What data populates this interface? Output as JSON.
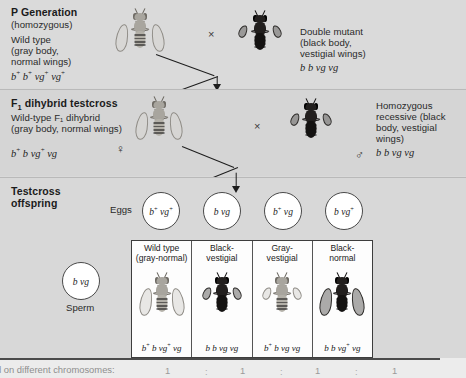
{
  "figure": {
    "background": "#d9d9d9"
  },
  "sections": {
    "p_generation": {
      "title": "P Generation",
      "subtitle": "(homozygous)",
      "cross_symbol": "×",
      "parents": [
        {
          "name": "Wild type",
          "description": "(gray body,\nnormal wings)",
          "desc_line1": "Wild type",
          "desc_line2": "(gray body,",
          "desc_line3": "normal wings)",
          "genotype_html": "b<sup>+</sup> b<sup>+</sup> vg<sup>+</sup> vg<sup>+</sup>",
          "body_color": "gray",
          "wing_type": "normal"
        },
        {
          "desc_line1": "Double mutant",
          "desc_line2": "(black body,",
          "desc_line3": "vestigial wings)",
          "genotype_html": "b b vg vg",
          "body_color": "black",
          "wing_type": "vestigial"
        }
      ]
    },
    "f1_testcross": {
      "title_main": "F",
      "title_sub": "1",
      "title_rest": " dihybrid testcross",
      "cross_symbol": "×",
      "female": {
        "desc_line1": "Wild-type F₁ dihybrid",
        "desc_line2": "(gray body, normal wings)",
        "genotype_html": "b<sup>+</sup> b vg<sup>+</sup> vg",
        "sex_symbol": "♀",
        "body_color": "gray",
        "wing_type": "normal"
      },
      "male": {
        "desc_line1": "Homozygous",
        "desc_line2": "recessive (black",
        "desc_line3": "body, vestigial",
        "desc_line4": "wings)",
        "genotype_html": "b b vg vg",
        "sex_symbol": "♂",
        "body_color": "black",
        "wing_type": "vestigial"
      }
    },
    "testcross_offspring": {
      "title_line1": "Testcross",
      "title_line2": "offspring",
      "eggs_label": "Eggs",
      "sperm_label": "Sperm",
      "eggs": [
        {
          "genotype_html": "b<sup>+</sup> vg<sup>+</sup>"
        },
        {
          "genotype_html": "b vg"
        },
        {
          "genotype_html": "b<sup>+</sup> vg"
        },
        {
          "genotype_html": "b vg<sup>+</sup>"
        }
      ],
      "sperm": {
        "genotype_html": "b vg"
      },
      "offspring": [
        {
          "name_line1": "Wild type",
          "name_line2": "(gray-normal)",
          "genotype_html": "b<sup>+</sup> b vg<sup>+</sup> vg",
          "body_color": "gray",
          "wing_type": "normal"
        },
        {
          "name_line1": "Black-",
          "name_line2": "vestigial",
          "genotype_html": "b b vg vg",
          "body_color": "black",
          "wing_type": "vestigial"
        },
        {
          "name_line1": "Gray-",
          "name_line2": "vestigial",
          "genotype_html": "b<sup>+</sup> b vg vg",
          "body_color": "gray",
          "wing_type": "vestigial"
        },
        {
          "name_line1": "Black-",
          "name_line2": "normal",
          "genotype_html": "b b vg<sup>+</sup> vg",
          "body_color": "black",
          "wing_type": "normal"
        }
      ]
    }
  },
  "bottom_caption": {
    "text": "d on different chromosomes:",
    "ratio": [
      "1",
      "1",
      "1",
      "1"
    ],
    "separator": ":"
  }
}
